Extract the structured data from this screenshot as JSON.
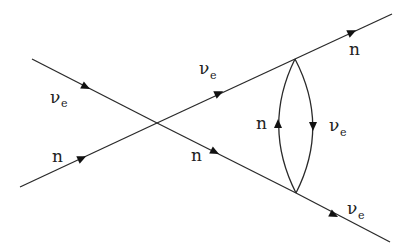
{
  "diagram": {
    "type": "feynman-diagram",
    "background_color": "#ffffff",
    "line_color": "#2a2a2a",
    "vertices": {
      "crossing": [
        157,
        123
      ],
      "loop_top": [
        295,
        59
      ],
      "loop_bottom": [
        296,
        193
      ]
    },
    "lines": [
      {
        "id": "incoming-nu",
        "from": [
          32,
          59
        ],
        "to": [
          157,
          123
        ],
        "label_main": "ν",
        "label_sub": "e",
        "direction": "forward"
      },
      {
        "id": "incoming-n",
        "from": [
          20,
          187
        ],
        "to": [
          157,
          123
        ],
        "label_main": "n",
        "label_sub": "",
        "direction": "forward"
      },
      {
        "id": "mid-nu",
        "from": [
          157,
          123
        ],
        "to": [
          295,
          59
        ],
        "label_main": "ν",
        "label_sub": "e",
        "direction": "forward"
      },
      {
        "id": "mid-n",
        "from": [
          157,
          123
        ],
        "to": [
          296,
          193
        ],
        "label_main": "n",
        "label_sub": "",
        "direction": "forward"
      },
      {
        "id": "outgoing-n",
        "from": [
          295,
          59
        ],
        "to": [
          392,
          14
        ],
        "label_main": "n",
        "label_sub": "",
        "direction": "forward"
      },
      {
        "id": "outgoing-nu",
        "from": [
          296,
          193
        ],
        "to": [
          390,
          242
        ],
        "label_main": "ν",
        "label_sub": "e",
        "direction": "forward"
      },
      {
        "id": "loop-left-n",
        "from": [
          296,
          193
        ],
        "to": [
          295,
          59
        ],
        "label_main": "n",
        "label_sub": "",
        "direction": "upward"
      },
      {
        "id": "loop-right-nu",
        "from": [
          295,
          59
        ],
        "to": [
          296,
          193
        ],
        "label_main": "ν",
        "label_sub": "e",
        "direction": "downward"
      }
    ]
  },
  "labels": {
    "incoming_nu": {
      "main": "ν",
      "sub": "e"
    },
    "incoming_n": {
      "main": "n"
    },
    "mid_nu": {
      "main": "ν",
      "sub": "e"
    },
    "mid_n": {
      "main": "n"
    },
    "outgoing_n": {
      "main": "n"
    },
    "outgoing_nu": {
      "main": "ν",
      "sub": "e"
    },
    "loop_n": {
      "main": "n"
    },
    "loop_nu": {
      "main": "ν",
      "sub": "e"
    }
  }
}
